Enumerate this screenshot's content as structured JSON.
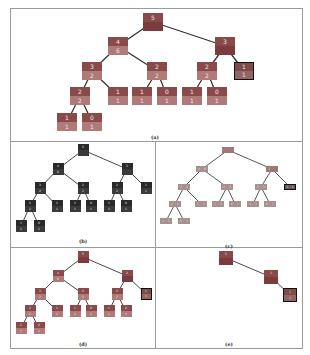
{
  "figure": {
    "panels": [
      {
        "id": "a",
        "caption": "(a)",
        "frame": {
          "x": 10,
          "y": 8,
          "w": 293,
          "h": 134
        },
        "caption_pos": {
          "x": 155,
          "y": 134
        },
        "node_size": {
          "w": 20,
          "h": 18
        },
        "font_size": 6,
        "style": "red-two-tone",
        "colors": {
          "top": "#8b4a4a",
          "bottom": "#b07a78",
          "root_bottom": "#7a3c3c",
          "edge": "#333333",
          "highlight_border": "#111111"
        },
        "nodes": [
          {
            "id": "n0",
            "x": 153,
            "y": 13,
            "top": "5",
            "bottom": "",
            "dark_bottom": true
          },
          {
            "id": "n1",
            "x": 118,
            "y": 37,
            "top": "4",
            "bottom": "6"
          },
          {
            "id": "n2",
            "x": 225,
            "y": 37,
            "top": "3",
            "bottom": "",
            "dark_bottom": true
          },
          {
            "id": "n3",
            "x": 92,
            "y": 62,
            "top": "3",
            "bottom": "2"
          },
          {
            "id": "n4",
            "x": 157,
            "y": 62,
            "top": "2",
            "bottom": "2"
          },
          {
            "id": "n5",
            "x": 207,
            "y": 62,
            "top": "2",
            "bottom": "2"
          },
          {
            "id": "n6",
            "x": 244,
            "y": 62,
            "top": "1",
            "bottom": "1",
            "highlight": true
          },
          {
            "id": "n7",
            "x": 80,
            "y": 87,
            "top": "2",
            "bottom": "2"
          },
          {
            "id": "n8",
            "x": 118,
            "y": 87,
            "top": "1",
            "bottom": "1"
          },
          {
            "id": "n9",
            "x": 142,
            "y": 87,
            "top": "1",
            "bottom": "1"
          },
          {
            "id": "n10",
            "x": 167,
            "y": 87,
            "top": "0",
            "bottom": "1"
          },
          {
            "id": "n11",
            "x": 192,
            "y": 87,
            "top": "1",
            "bottom": "1"
          },
          {
            "id": "n12",
            "x": 217,
            "y": 87,
            "top": "0",
            "bottom": "1"
          },
          {
            "id": "n13",
            "x": 67,
            "y": 113,
            "top": "1",
            "bottom": "1"
          },
          {
            "id": "n14",
            "x": 92,
            "y": 113,
            "top": "0",
            "bottom": "1"
          }
        ],
        "edges": [
          [
            "n0",
            "n1"
          ],
          [
            "n0",
            "n2"
          ],
          [
            "n1",
            "n3"
          ],
          [
            "n1",
            "n4"
          ],
          [
            "n2",
            "n5"
          ],
          [
            "n2",
            "n6"
          ],
          [
            "n3",
            "n7"
          ],
          [
            "n3",
            "n8"
          ],
          [
            "n4",
            "n9"
          ],
          [
            "n4",
            "n10"
          ],
          [
            "n5",
            "n11"
          ],
          [
            "n5",
            "n12"
          ],
          [
            "n7",
            "n13"
          ],
          [
            "n7",
            "n14"
          ]
        ]
      },
      {
        "id": "b",
        "caption": "(b)",
        "frame": {
          "x": 10,
          "y": 141,
          "w": 146,
          "h": 107
        },
        "caption_pos": {
          "x": 83,
          "y": 238
        },
        "node_size": {
          "w": 11,
          "h": 12
        },
        "font_size": 3,
        "style": "dark",
        "colors": {
          "top": "#2a2a2a",
          "bottom": "#3a3a3a",
          "root_bottom": "#2a2a2a",
          "edge": "#333333",
          "highlight_border": "#111111"
        },
        "nodes": [
          {
            "id": "n0",
            "x": 83,
            "y": 144,
            "top": "5",
            "bottom": ""
          },
          {
            "id": "n1",
            "x": 58,
            "y": 163,
            "top": "4",
            "bottom": "6"
          },
          {
            "id": "n2",
            "x": 127,
            "y": 163,
            "top": "3",
            "bottom": ""
          },
          {
            "id": "n3",
            "x": 40,
            "y": 182,
            "top": "3",
            "bottom": "2"
          },
          {
            "id": "n4",
            "x": 83,
            "y": 182,
            "top": "2",
            "bottom": "2"
          },
          {
            "id": "n5",
            "x": 117,
            "y": 182,
            "top": "2",
            "bottom": "2"
          },
          {
            "id": "n6",
            "x": 146,
            "y": 182,
            "top": "1",
            "bottom": "1"
          },
          {
            "id": "n7",
            "x": 30,
            "y": 200,
            "top": "2",
            "bottom": "2"
          },
          {
            "id": "n8",
            "x": 57,
            "y": 200,
            "top": "1",
            "bottom": "1"
          },
          {
            "id": "n9",
            "x": 75,
            "y": 200,
            "top": "1",
            "bottom": "1"
          },
          {
            "id": "n10",
            "x": 91,
            "y": 200,
            "top": "0",
            "bottom": "1"
          },
          {
            "id": "n11",
            "x": 109,
            "y": 200,
            "top": "1",
            "bottom": "1"
          },
          {
            "id": "n12",
            "x": 126,
            "y": 200,
            "top": "0",
            "bottom": "1"
          },
          {
            "id": "n13",
            "x": 21,
            "y": 220,
            "top": "1",
            "bottom": "1"
          },
          {
            "id": "n14",
            "x": 39,
            "y": 220,
            "top": "0",
            "bottom": "1"
          }
        ],
        "edges": [
          [
            "n0",
            "n1"
          ],
          [
            "n0",
            "n2"
          ],
          [
            "n1",
            "n3"
          ],
          [
            "n1",
            "n4"
          ],
          [
            "n2",
            "n5"
          ],
          [
            "n2",
            "n6"
          ],
          [
            "n3",
            "n7"
          ],
          [
            "n3",
            "n8"
          ],
          [
            "n4",
            "n9"
          ],
          [
            "n4",
            "n10"
          ],
          [
            "n5",
            "n11"
          ],
          [
            "n5",
            "n12"
          ],
          [
            "n7",
            "n13"
          ],
          [
            "n7",
            "n14"
          ]
        ]
      },
      {
        "id": "c",
        "caption": "(c)",
        "frame": {
          "x": 155,
          "y": 141,
          "w": 148,
          "h": 107
        },
        "caption_pos": {
          "x": 229,
          "y": 243
        },
        "node_size": {
          "w": 12,
          "h": 6
        },
        "font_size": 3,
        "style": "flat-gray",
        "colors": {
          "top": "#a89090",
          "bottom": "#a89090",
          "root": "#a07676",
          "edge": "#444444",
          "highlight": "#6a5a5a",
          "highlight_border": "#111111"
        },
        "nodes": [
          {
            "id": "n0",
            "x": 228,
            "y": 147,
            "top": "",
            "bottom": "",
            "root": true
          },
          {
            "id": "n1",
            "x": 202,
            "y": 166,
            "top": "4",
            "bottom": "6"
          },
          {
            "id": "n2",
            "x": 272,
            "y": 166,
            "top": "3",
            "bottom": "",
            "root": true
          },
          {
            "id": "n3",
            "x": 184,
            "y": 184,
            "top": "3",
            "bottom": "2"
          },
          {
            "id": "n4",
            "x": 227,
            "y": 184,
            "top": "2",
            "bottom": "2"
          },
          {
            "id": "n5",
            "x": 261,
            "y": 184,
            "top": "2",
            "bottom": "2"
          },
          {
            "id": "n6",
            "x": 290,
            "y": 184,
            "top": "1",
            "bottom": "1",
            "highlight": true
          },
          {
            "id": "n7",
            "x": 175,
            "y": 201,
            "top": "2",
            "bottom": "2"
          },
          {
            "id": "n8",
            "x": 201,
            "y": 201,
            "top": "1",
            "bottom": "1"
          },
          {
            "id": "n9",
            "x": 218,
            "y": 201,
            "top": "1",
            "bottom": "1"
          },
          {
            "id": "n10",
            "x": 235,
            "y": 201,
            "top": "0",
            "bottom": "1"
          },
          {
            "id": "n11",
            "x": 253,
            "y": 201,
            "top": "1",
            "bottom": "1"
          },
          {
            "id": "n12",
            "x": 270,
            "y": 201,
            "top": "0",
            "bottom": "1"
          },
          {
            "id": "n13",
            "x": 166,
            "y": 218,
            "top": "1",
            "bottom": "1"
          },
          {
            "id": "n14",
            "x": 184,
            "y": 218,
            "top": "0",
            "bottom": "1"
          }
        ],
        "edges": [
          [
            "n0",
            "n1"
          ],
          [
            "n0",
            "n2"
          ],
          [
            "n1",
            "n3"
          ],
          [
            "n1",
            "n4"
          ],
          [
            "n2",
            "n5"
          ],
          [
            "n2",
            "n6"
          ],
          [
            "n3",
            "n7"
          ],
          [
            "n3",
            "n8"
          ],
          [
            "n4",
            "n9"
          ],
          [
            "n4",
            "n10"
          ],
          [
            "n5",
            "n11"
          ],
          [
            "n5",
            "n12"
          ],
          [
            "n7",
            "n13"
          ],
          [
            "n7",
            "n14"
          ]
        ]
      },
      {
        "id": "d",
        "caption": "(d)",
        "frame": {
          "x": 10,
          "y": 247,
          "w": 146,
          "h": 102
        },
        "caption_pos": {
          "x": 83,
          "y": 341
        },
        "node_size": {
          "w": 11,
          "h": 12
        },
        "font_size": 3,
        "style": "red-two-tone",
        "colors": {
          "top": "#8b4a4a",
          "bottom": "#b07a78",
          "root_bottom": "#7a3c3c",
          "edge": "#333333",
          "highlight_border": "#111111"
        },
        "nodes": [
          {
            "id": "n0",
            "x": 83,
            "y": 251,
            "top": "5",
            "bottom": "",
            "dark_bottom": true
          },
          {
            "id": "n1",
            "x": 58,
            "y": 270,
            "top": "4",
            "bottom": "6"
          },
          {
            "id": "n2",
            "x": 127,
            "y": 270,
            "top": "3",
            "bottom": "",
            "dark_bottom": true
          },
          {
            "id": "n3",
            "x": 40,
            "y": 288,
            "top": "3",
            "bottom": "2"
          },
          {
            "id": "n4",
            "x": 83,
            "y": 288,
            "top": "2",
            "bottom": "2"
          },
          {
            "id": "n5",
            "x": 117,
            "y": 288,
            "top": "2",
            "bottom": "2"
          },
          {
            "id": "n6",
            "x": 146,
            "y": 288,
            "top": "1",
            "bottom": "1",
            "highlight": true
          },
          {
            "id": "n7",
            "x": 30,
            "y": 305,
            "top": "2",
            "bottom": "2"
          },
          {
            "id": "n8",
            "x": 57,
            "y": 305,
            "top": "1",
            "bottom": "1"
          },
          {
            "id": "n9",
            "x": 75,
            "y": 305,
            "top": "1",
            "bottom": "1"
          },
          {
            "id": "n10",
            "x": 91,
            "y": 305,
            "top": "0",
            "bottom": "1"
          },
          {
            "id": "n11",
            "x": 109,
            "y": 305,
            "top": "1",
            "bottom": "1"
          },
          {
            "id": "n12",
            "x": 126,
            "y": 305,
            "top": "0",
            "bottom": "1"
          },
          {
            "id": "n13",
            "x": 21,
            "y": 322,
            "top": "1",
            "bottom": "1"
          },
          {
            "id": "n14",
            "x": 39,
            "y": 322,
            "top": "0",
            "bottom": "1"
          }
        ],
        "edges": [
          [
            "n0",
            "n1"
          ],
          [
            "n0",
            "n2"
          ],
          [
            "n1",
            "n3"
          ],
          [
            "n1",
            "n4"
          ],
          [
            "n2",
            "n5"
          ],
          [
            "n2",
            "n6"
          ],
          [
            "n3",
            "n7"
          ],
          [
            "n3",
            "n8"
          ],
          [
            "n4",
            "n9"
          ],
          [
            "n4",
            "n10"
          ],
          [
            "n5",
            "n11"
          ],
          [
            "n5",
            "n12"
          ],
          [
            "n7",
            "n13"
          ],
          [
            "n7",
            "n14"
          ]
        ]
      },
      {
        "id": "e",
        "caption": "(e)",
        "frame": {
          "x": 155,
          "y": 247,
          "w": 148,
          "h": 102
        },
        "caption_pos": {
          "x": 229,
          "y": 341
        },
        "node_size": {
          "w": 14,
          "h": 14
        },
        "font_size": 3,
        "style": "red-two-tone",
        "colors": {
          "top": "#8b4a4a",
          "bottom": "#9a5a58",
          "root_bottom": "#7a3c3c",
          "edge": "#333333",
          "highlight_border": "#111111"
        },
        "nodes": [
          {
            "id": "n0",
            "x": 226,
            "y": 251,
            "top": "5",
            "bottom": "",
            "dark_bottom": true
          },
          {
            "id": "n1",
            "x": 271,
            "y": 270,
            "top": "3",
            "bottom": "",
            "dark_bottom": true
          },
          {
            "id": "n2",
            "x": 290,
            "y": 288,
            "top": "1",
            "bottom": "1",
            "highlight": true
          }
        ],
        "edges": [
          [
            "n0",
            "n1"
          ],
          [
            "n1",
            "n2"
          ]
        ]
      }
    ]
  }
}
